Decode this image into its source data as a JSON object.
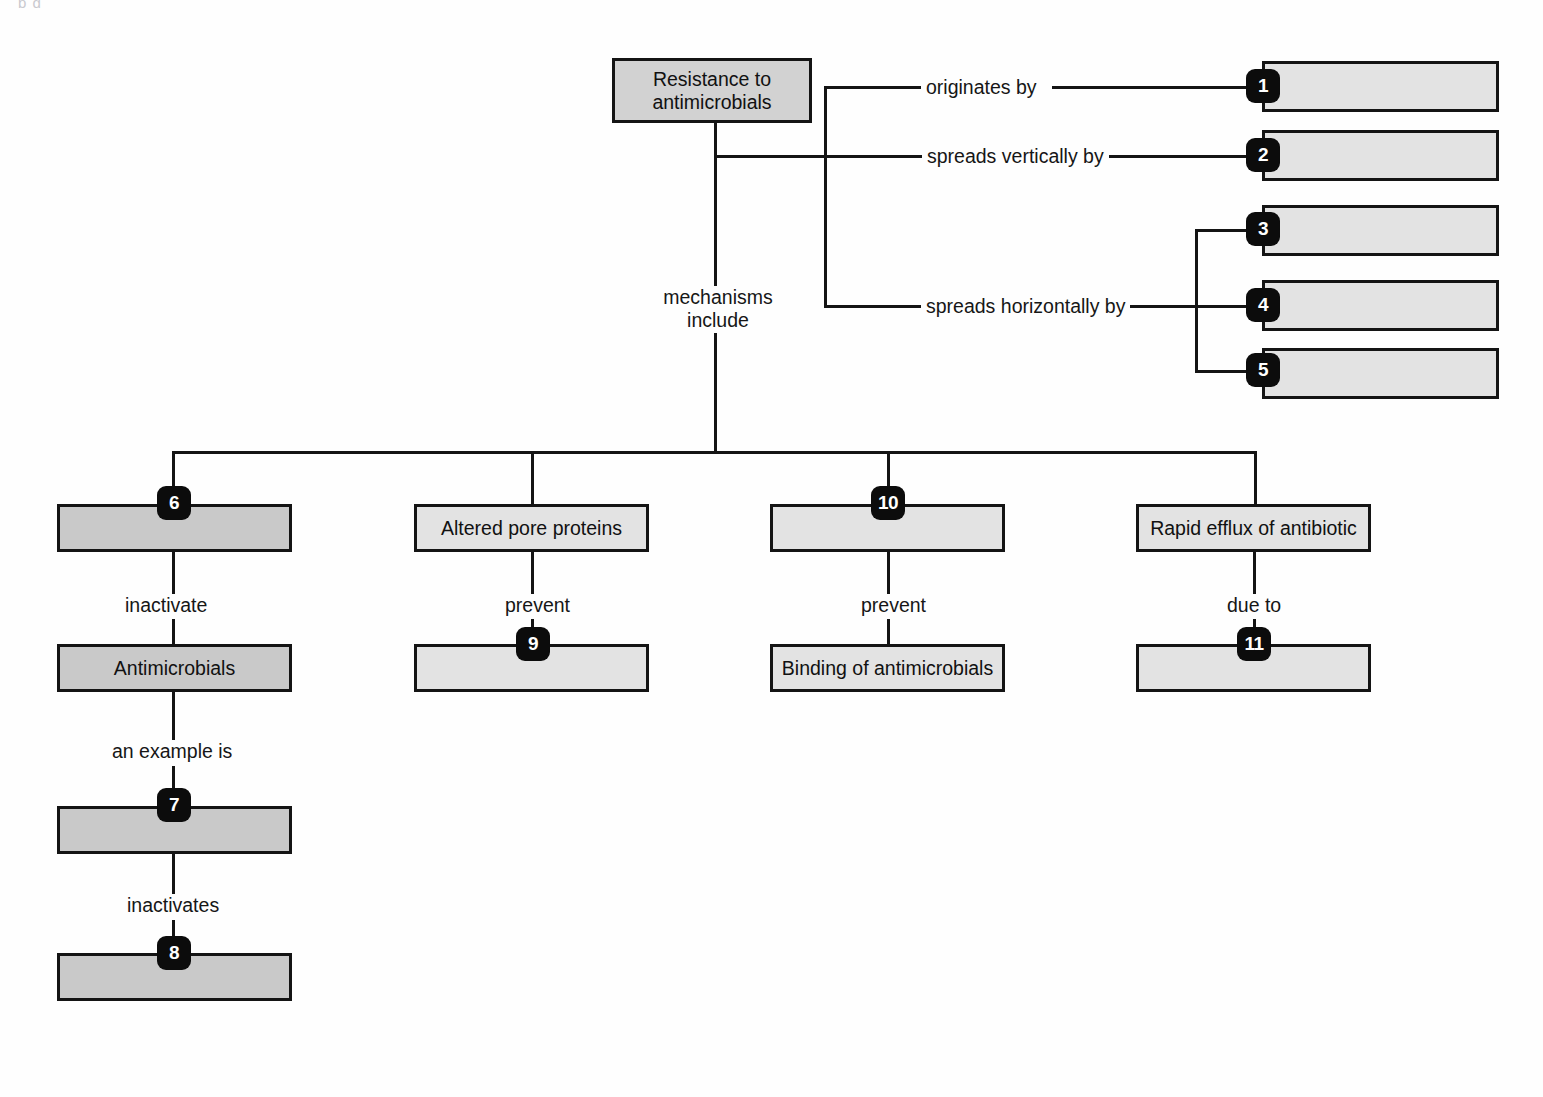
{
  "diagram": {
    "type": "concept-map",
    "artifact_text": "p g",
    "colors": {
      "stroke": "#141414",
      "badge_background": "#0c0c0c",
      "badge_text": "#ffffff",
      "fill_light": "#e3e3e3",
      "fill_mid": "#d2d2d2",
      "fill_dark": "#c9c9c9",
      "page_background": "#fefefe"
    }
  },
  "root": {
    "label": "Resistance to antimicrobials"
  },
  "link_labels": {
    "originates_by": "originates by",
    "spreads_vertically_by": "spreads vertically by",
    "spreads_horizontally_by": "spreads horizontally by",
    "mechanisms_include": "mechanisms include",
    "inactivate": "inactivate",
    "prevent_pore": "prevent",
    "prevent_binding": "prevent",
    "due_to": "due to",
    "an_example_is": "an example is",
    "inactivates": "inactivates"
  },
  "blanks": [
    {
      "number": "1",
      "label": "",
      "badge_position": "left"
    },
    {
      "number": "2",
      "label": "",
      "badge_position": "left"
    },
    {
      "number": "3",
      "label": "",
      "badge_position": "left"
    },
    {
      "number": "4",
      "label": "",
      "badge_position": "left"
    },
    {
      "number": "5",
      "label": "",
      "badge_position": "left"
    },
    {
      "number": "6",
      "label": "",
      "badge_position": "top"
    },
    {
      "number": "7",
      "label": "",
      "badge_position": "top"
    },
    {
      "number": "8",
      "label": "",
      "badge_position": "top"
    },
    {
      "number": "9",
      "label": "",
      "badge_position": "top"
    },
    {
      "number": "10",
      "label": "",
      "badge_position": "top"
    },
    {
      "number": "11",
      "label": "",
      "badge_position": "top"
    }
  ],
  "nodes": {
    "blank1": {
      "number": "1",
      "label": ""
    },
    "blank2": {
      "number": "2",
      "label": ""
    },
    "blank3": {
      "number": "3",
      "label": ""
    },
    "blank4": {
      "number": "4",
      "label": ""
    },
    "blank5": {
      "number": "5",
      "label": ""
    },
    "blank6": {
      "number": "6",
      "label": ""
    },
    "blank7": {
      "number": "7",
      "label": ""
    },
    "blank8": {
      "number": "8",
      "label": ""
    },
    "blank9": {
      "number": "9",
      "label": ""
    },
    "blank10": {
      "number": "10",
      "label": ""
    },
    "blank11": {
      "number": "11",
      "label": ""
    },
    "altered_pore_proteins": {
      "label": "Altered pore proteins"
    },
    "rapid_efflux": {
      "label": "Rapid efflux of antibiotic"
    },
    "antimicrobials": {
      "label": "Antimicrobials"
    },
    "binding_of_antimicrobials": {
      "label": "Binding of antimicrobials"
    }
  }
}
